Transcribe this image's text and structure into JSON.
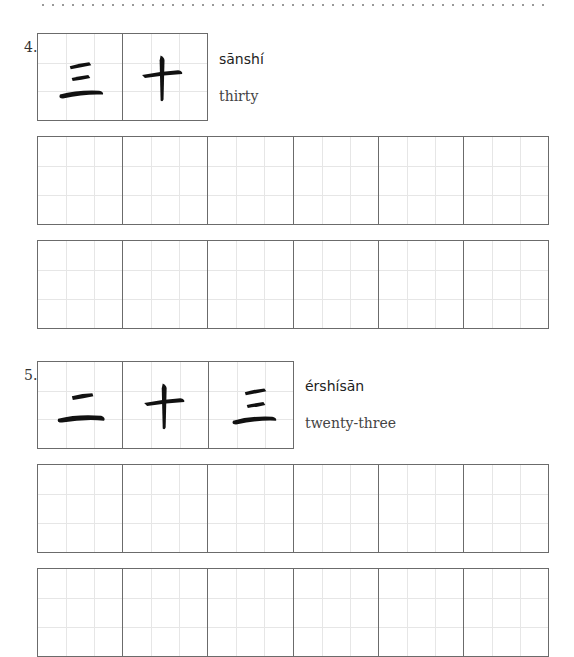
{
  "items": [
    {
      "number": "4.",
      "characters": [
        "三",
        "十"
      ],
      "pinyin": "sānshí",
      "meaning": "thirty"
    },
    {
      "number": "5.",
      "characters": [
        "二",
        "十",
        "三"
      ],
      "pinyin": "érshísān",
      "meaning": "twenty-three"
    }
  ],
  "practice_cells_per_row": 6,
  "colors": {
    "border": "#6b6b6b",
    "guide": "#e6e6e6",
    "ink": "#111111"
  }
}
